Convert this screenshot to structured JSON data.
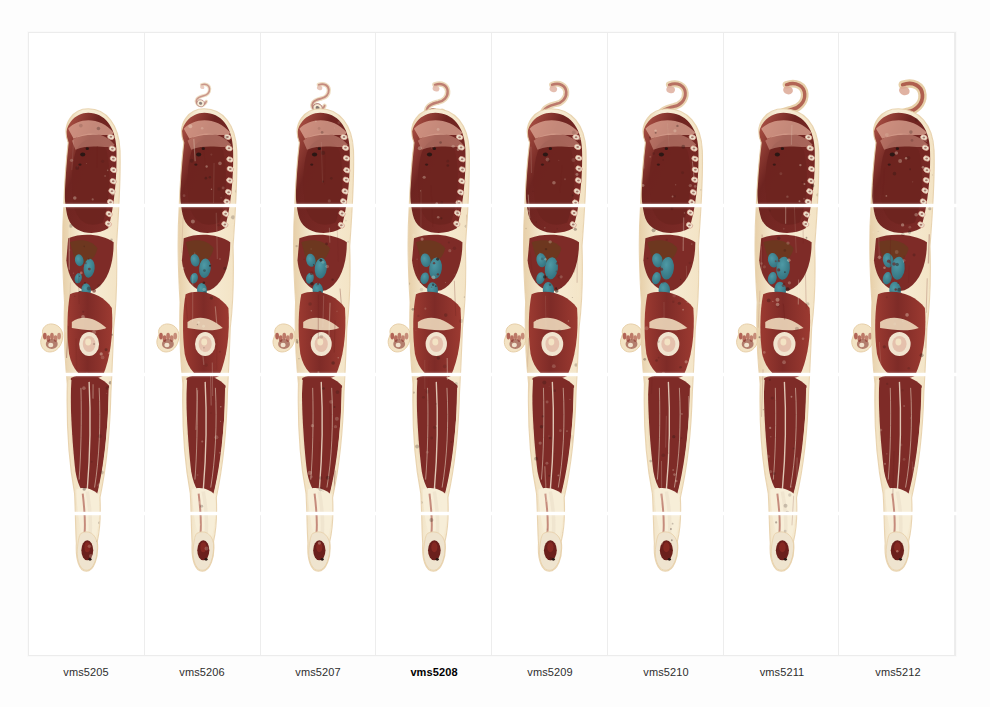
{
  "viewer": {
    "title": "VMS Sagittal Cryosection Slice Strip",
    "background_color": "#fdfdfd",
    "panel_background": "#ffffff",
    "panel_divider_color": "#ededed",
    "reference_line_color": "#ffffff",
    "selected_slice": "vms5208"
  },
  "reference_lines": [
    {
      "name": "upper-reference-line",
      "y_px": 203
    },
    {
      "name": "mid-reference-line",
      "y_px": 372
    },
    {
      "name": "lower-reference-line",
      "y_px": 511
    }
  ],
  "palette": {
    "muscle_dark": "#7e2b27",
    "muscle_mid": "#9c3a31",
    "muscle_light": "#b85a4c",
    "thorax_maroon": "#6e2420",
    "fat_cream": "#f3e3c4",
    "fat_pale": "#f7eed8",
    "skin_tan": "#e7cfa8",
    "bone_pale": "#efe4cf",
    "bowel_teal": "#3f8a96",
    "bowel_teal_dark": "#2f6b78",
    "marrow_dark": "#6b1f1c",
    "rib_pink": "#dba492",
    "void_dark": "#2b1714",
    "label_text": "#2e2e2e"
  },
  "slices": [
    {
      "id": "vms5205",
      "label": "vms5205",
      "index": 0,
      "selected": false,
      "has_detached_top_fragment": false,
      "top_fragment_scale": 0.0,
      "has_left_hand_fragment": true,
      "bowel_visible": true,
      "bowel_extent": 0.62,
      "body_width_factor": 0.92,
      "thorax_offset": 0
    },
    {
      "id": "vms5206",
      "label": "vms5206",
      "index": 1,
      "selected": false,
      "has_detached_top_fragment": true,
      "top_fragment_scale": 0.25,
      "has_left_hand_fragment": true,
      "bowel_visible": true,
      "bowel_extent": 0.7,
      "body_width_factor": 0.94,
      "thorax_offset": 1
    },
    {
      "id": "vms5207",
      "label": "vms5207",
      "index": 2,
      "selected": false,
      "has_detached_top_fragment": true,
      "top_fragment_scale": 0.38,
      "has_left_hand_fragment": true,
      "bowel_visible": true,
      "bowel_extent": 0.78,
      "body_width_factor": 0.96,
      "thorax_offset": 2
    },
    {
      "id": "vms5208",
      "label": "vms5208",
      "index": 3,
      "selected": true,
      "has_detached_top_fragment": true,
      "top_fragment_scale": 0.55,
      "has_left_hand_fragment": true,
      "bowel_visible": true,
      "bowel_extent": 0.88,
      "body_width_factor": 0.98,
      "thorax_offset": 3
    },
    {
      "id": "vms5209",
      "label": "vms5209",
      "index": 4,
      "selected": false,
      "has_detached_top_fragment": true,
      "top_fragment_scale": 0.64,
      "has_left_hand_fragment": true,
      "bowel_visible": true,
      "bowel_extent": 0.92,
      "body_width_factor": 1.0,
      "thorax_offset": 4
    },
    {
      "id": "vms5210",
      "label": "vms5210",
      "index": 5,
      "selected": false,
      "has_detached_top_fragment": true,
      "top_fragment_scale": 0.76,
      "has_left_hand_fragment": true,
      "bowel_visible": true,
      "bowel_extent": 0.96,
      "body_width_factor": 1.01,
      "thorax_offset": 5
    },
    {
      "id": "vms5211",
      "label": "vms5211",
      "index": 6,
      "selected": false,
      "has_detached_top_fragment": true,
      "top_fragment_scale": 0.9,
      "has_left_hand_fragment": true,
      "bowel_visible": true,
      "bowel_extent": 1.0,
      "body_width_factor": 1.02,
      "thorax_offset": 6
    },
    {
      "id": "vms5212",
      "label": "vms5212",
      "index": 7,
      "selected": false,
      "has_detached_top_fragment": true,
      "top_fragment_scale": 1.0,
      "has_left_hand_fragment": true,
      "bowel_visible": true,
      "bowel_extent": 1.0,
      "body_width_factor": 1.03,
      "thorax_offset": 7
    }
  ]
}
